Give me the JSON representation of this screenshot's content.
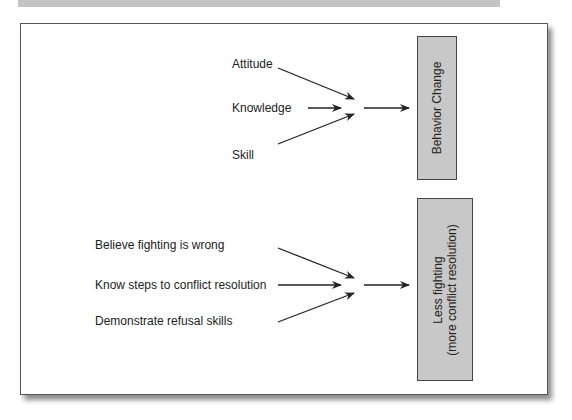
{
  "diagram": {
    "top_model": {
      "inputs": [
        "Attitude",
        "Knowledge",
        "Skill"
      ],
      "outcome": "Behavior Change"
    },
    "bottom_model": {
      "inputs": [
        "Believe fighting is wrong",
        "Know steps to conflict resolution",
        "Demonstrate refusal skills"
      ],
      "outcome_line1": "Less fighting",
      "outcome_line2": "(more conflict resolution)"
    }
  },
  "colors": {
    "box_fill": "#c8c8c8",
    "box_border": "#444444",
    "arrow": "#222222",
    "header_bar": "#c4c4c4"
  }
}
